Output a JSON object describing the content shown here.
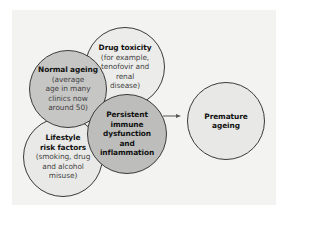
{
  "diagram": {
    "colors": {
      "background": "#f3f3f1",
      "dark_fill": "#c4c4c2",
      "light_fill": "#ececea",
      "outline": "#3a3a3a"
    },
    "nodes": {
      "drug_toxicity": {
        "title": "Drug toxicity",
        "sub": [
          "(for example,",
          "tenofovir and",
          "renal",
          "disease)"
        ]
      },
      "normal_ageing": {
        "title": "Normal ageing",
        "sub": [
          "(average",
          "age in many",
          "clinics now",
          "around 50)"
        ]
      },
      "lifestyle": {
        "title": [
          "Lifestyle",
          "risk factors"
        ],
        "sub": [
          "(smoking, drug",
          "and alcohol",
          "misuse)"
        ]
      },
      "persistent": {
        "title": [
          "Persistent",
          "immune",
          "dysfunction",
          "and",
          "inflammation"
        ]
      },
      "premature": {
        "title": [
          "Premature",
          "ageing"
        ]
      }
    },
    "edges": [
      {
        "from": "persistent",
        "to": "premature",
        "type": "arrow"
      }
    ]
  }
}
